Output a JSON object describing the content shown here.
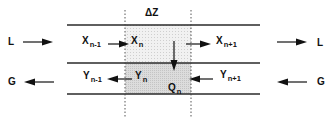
{
  "diagram": {
    "segment_label": "ΔZ",
    "flows": {
      "liquid_in": "L",
      "liquid_out": "L",
      "gas_out": "G",
      "gas_in": "G"
    },
    "liquid_stage": [
      {
        "main": "X",
        "sub": "n-1"
      },
      {
        "main": "X",
        "sub": "n"
      },
      {
        "main": "X",
        "sub": "n+1"
      }
    ],
    "gas_stage": [
      {
        "main": "Y",
        "sub": "n-1"
      },
      {
        "main": "Y",
        "sub": "n"
      },
      {
        "main": "Y",
        "sub": "n+1"
      }
    ],
    "transfer": {
      "main": "Q",
      "sub": "n"
    },
    "colors": {
      "line": "#2a2a2a",
      "dashed": "#444444",
      "upper_shade": "#ececec",
      "lower_shade": "#d6d6d6"
    }
  }
}
